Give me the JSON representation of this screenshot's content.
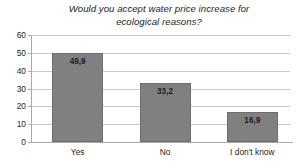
{
  "chart_data": {
    "type": "bar",
    "title": "Would you accept water price increase for\necological reasons?",
    "categories": [
      "Yes",
      "No",
      "I don't know"
    ],
    "values": [
      49.9,
      33.2,
      16.9
    ],
    "value_labels": [
      "49,9",
      "33,2",
      "16,9"
    ],
    "xlabel": "",
    "ylabel": "",
    "ylim": [
      0,
      60
    ],
    "ytick_labels": [
      "60",
      "50",
      "40",
      "30",
      "20",
      "10",
      "0"
    ],
    "ytick_values": [
      60,
      50,
      40,
      30,
      20,
      10,
      0
    ],
    "grid": true,
    "legend": "none",
    "bar_color": "#808080",
    "gridline_color": "#c8c8c8",
    "axis_color": "#a9a9a9",
    "text_color": "#231f20",
    "background": "#ffffff"
  }
}
